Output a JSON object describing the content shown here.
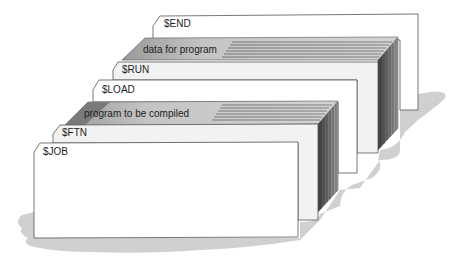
{
  "diagram": {
    "cards": [
      {
        "id": "end",
        "label": "$END",
        "kind": "control"
      },
      {
        "id": "data",
        "label": "data for program",
        "kind": "data-deck"
      },
      {
        "id": "run",
        "label": "$RUN",
        "kind": "control"
      },
      {
        "id": "load",
        "label": "$LOAD",
        "kind": "control"
      },
      {
        "id": "program",
        "label": "program to be compiled",
        "kind": "data-deck"
      },
      {
        "id": "ftn",
        "label": "$FTN",
        "kind": "control"
      },
      {
        "id": "job",
        "label": "$JOB",
        "kind": "control"
      }
    ],
    "colors": {
      "card": "#ffffff",
      "card_side": "#eeeeee",
      "deck_top": "#bdbdbd",
      "deck_edge_dark": "#5a5a5a",
      "shadow": "#cfcfcf",
      "outline": "#555555"
    }
  }
}
